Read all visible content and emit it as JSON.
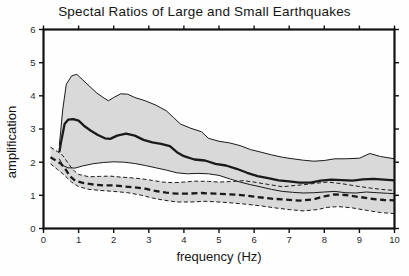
{
  "figure": {
    "background": "#fefefe"
  },
  "chart_data": {
    "type": "line",
    "title": "Spectal Ratios of Large and Small Earthquakes",
    "xlabel": "frequency (Hz)",
    "ylabel": "amplification",
    "xlim": [
      0,
      10
    ],
    "ylim": [
      0,
      6
    ],
    "xticks": [
      0,
      1,
      2,
      3,
      4,
      5,
      6,
      7,
      8,
      9,
      10
    ],
    "yticks": [
      0,
      1,
      2,
      3,
      4,
      5,
      6
    ],
    "grid": false,
    "legend": "none",
    "colors": {
      "band_fill": "#d9d9d9",
      "line": "#1a1a1a",
      "frame": "#111111"
    },
    "series": [
      {
        "name": "large-earthquakes-upper-bound",
        "group": "large",
        "role": "upper",
        "line_style": "solid",
        "line_weight": "thin",
        "points": [
          [
            0.45,
            2.5
          ],
          [
            0.55,
            3.6
          ],
          [
            0.65,
            4.35
          ],
          [
            0.8,
            4.6
          ],
          [
            0.95,
            4.65
          ],
          [
            1.1,
            4.5
          ],
          [
            1.3,
            4.3
          ],
          [
            1.5,
            4.1
          ],
          [
            1.7,
            3.95
          ],
          [
            1.85,
            3.85
          ],
          [
            2.0,
            3.95
          ],
          [
            2.2,
            4.06
          ],
          [
            2.4,
            4.05
          ],
          [
            2.6,
            3.95
          ],
          [
            2.9,
            3.85
          ],
          [
            3.2,
            3.72
          ],
          [
            3.5,
            3.55
          ],
          [
            3.7,
            3.35
          ],
          [
            3.9,
            3.15
          ],
          [
            4.2,
            3.02
          ],
          [
            4.5,
            2.92
          ],
          [
            4.7,
            2.72
          ],
          [
            5.0,
            2.63
          ],
          [
            5.3,
            2.58
          ],
          [
            5.6,
            2.5
          ],
          [
            5.9,
            2.38
          ],
          [
            6.2,
            2.3
          ],
          [
            6.5,
            2.22
          ],
          [
            6.8,
            2.15
          ],
          [
            7.1,
            2.1
          ],
          [
            7.4,
            2.06
          ],
          [
            7.7,
            2.03
          ],
          [
            8.0,
            2.05
          ],
          [
            8.3,
            2.1
          ],
          [
            8.6,
            2.1
          ],
          [
            9.0,
            2.12
          ],
          [
            9.3,
            2.26
          ],
          [
            9.6,
            2.17
          ],
          [
            10,
            2.1
          ]
        ]
      },
      {
        "name": "large-earthquakes-mean",
        "group": "large",
        "role": "mean",
        "line_style": "solid",
        "line_weight": "thick",
        "points": [
          [
            0.45,
            2.3
          ],
          [
            0.5,
            2.6
          ],
          [
            0.6,
            3.15
          ],
          [
            0.7,
            3.28
          ],
          [
            0.85,
            3.3
          ],
          [
            1.0,
            3.25
          ],
          [
            1.15,
            3.1
          ],
          [
            1.35,
            2.95
          ],
          [
            1.55,
            2.82
          ],
          [
            1.75,
            2.72
          ],
          [
            1.9,
            2.7
          ],
          [
            2.1,
            2.8
          ],
          [
            2.35,
            2.86
          ],
          [
            2.6,
            2.8
          ],
          [
            2.85,
            2.67
          ],
          [
            3.1,
            2.6
          ],
          [
            3.35,
            2.55
          ],
          [
            3.6,
            2.48
          ],
          [
            3.8,
            2.3
          ],
          [
            4.0,
            2.18
          ],
          [
            4.3,
            2.08
          ],
          [
            4.6,
            2.05
          ],
          [
            4.9,
            1.95
          ],
          [
            5.2,
            1.9
          ],
          [
            5.5,
            1.8
          ],
          [
            5.8,
            1.68
          ],
          [
            6.1,
            1.58
          ],
          [
            6.4,
            1.52
          ],
          [
            6.7,
            1.45
          ],
          [
            7.0,
            1.42
          ],
          [
            7.3,
            1.38
          ],
          [
            7.6,
            1.38
          ],
          [
            7.9,
            1.44
          ],
          [
            8.2,
            1.47
          ],
          [
            8.5,
            1.46
          ],
          [
            8.8,
            1.44
          ],
          [
            9.1,
            1.48
          ],
          [
            9.4,
            1.5
          ],
          [
            9.7,
            1.47
          ],
          [
            10,
            1.45
          ]
        ]
      },
      {
        "name": "large-earthquakes-lower-bound",
        "group": "large",
        "role": "lower",
        "line_style": "solid",
        "line_weight": "thin",
        "points": [
          [
            0.45,
            2.1
          ],
          [
            0.55,
            1.9
          ],
          [
            0.7,
            1.83
          ],
          [
            0.9,
            1.82
          ],
          [
            1.1,
            1.88
          ],
          [
            1.4,
            1.95
          ],
          [
            1.7,
            1.99
          ],
          [
            2.0,
            2.01
          ],
          [
            2.3,
            2.0
          ],
          [
            2.6,
            1.96
          ],
          [
            2.9,
            1.9
          ],
          [
            3.2,
            1.83
          ],
          [
            3.5,
            1.76
          ],
          [
            3.8,
            1.68
          ],
          [
            4.1,
            1.65
          ],
          [
            4.4,
            1.66
          ],
          [
            4.7,
            1.65
          ],
          [
            5.0,
            1.6
          ],
          [
            5.3,
            1.5
          ],
          [
            5.6,
            1.4
          ],
          [
            5.9,
            1.32
          ],
          [
            6.2,
            1.25
          ],
          [
            6.5,
            1.18
          ],
          [
            6.8,
            1.12
          ],
          [
            7.1,
            1.09
          ],
          [
            7.4,
            1.07
          ],
          [
            7.7,
            1.08
          ],
          [
            8.0,
            1.1
          ],
          [
            8.3,
            1.12
          ],
          [
            8.6,
            1.08
          ],
          [
            8.9,
            1.07
          ],
          [
            9.2,
            1.1
          ],
          [
            9.5,
            1.08
          ],
          [
            9.8,
            1.06
          ],
          [
            10,
            1.05
          ]
        ]
      },
      {
        "name": "small-earthquakes-upper-bound",
        "group": "small",
        "role": "upper",
        "line_style": "dashed",
        "line_weight": "thin",
        "points": [
          [
            0.2,
            2.45
          ],
          [
            0.4,
            2.32
          ],
          [
            0.55,
            2.2
          ],
          [
            0.7,
            1.97
          ],
          [
            0.85,
            1.76
          ],
          [
            1.0,
            1.63
          ],
          [
            1.3,
            1.56
          ],
          [
            1.6,
            1.57
          ],
          [
            1.9,
            1.58
          ],
          [
            2.2,
            1.55
          ],
          [
            2.5,
            1.53
          ],
          [
            2.8,
            1.5
          ],
          [
            3.1,
            1.45
          ],
          [
            3.4,
            1.4
          ],
          [
            3.7,
            1.38
          ],
          [
            4.0,
            1.4
          ],
          [
            4.3,
            1.43
          ],
          [
            4.7,
            1.42
          ],
          [
            5.0,
            1.4
          ],
          [
            5.4,
            1.42
          ],
          [
            5.7,
            1.44
          ],
          [
            6.0,
            1.4
          ],
          [
            6.4,
            1.33
          ],
          [
            6.8,
            1.26
          ],
          [
            7.2,
            1.3
          ],
          [
            7.5,
            1.33
          ],
          [
            7.8,
            1.37
          ],
          [
            8.1,
            1.4
          ],
          [
            8.5,
            1.35
          ],
          [
            8.9,
            1.28
          ],
          [
            9.3,
            1.22
          ],
          [
            9.7,
            1.17
          ],
          [
            10,
            1.15
          ]
        ]
      },
      {
        "name": "small-earthquakes-mean",
        "group": "small",
        "role": "mean",
        "line_style": "dashed",
        "line_weight": "thick",
        "points": [
          [
            0.2,
            2.15
          ],
          [
            0.35,
            2.05
          ],
          [
            0.5,
            1.95
          ],
          [
            0.62,
            1.8
          ],
          [
            0.75,
            1.58
          ],
          [
            0.9,
            1.44
          ],
          [
            1.1,
            1.38
          ],
          [
            1.4,
            1.33
          ],
          [
            1.7,
            1.3
          ],
          [
            2.0,
            1.3
          ],
          [
            2.3,
            1.27
          ],
          [
            2.6,
            1.24
          ],
          [
            2.9,
            1.2
          ],
          [
            3.2,
            1.13
          ],
          [
            3.5,
            1.08
          ],
          [
            3.8,
            1.05
          ],
          [
            4.1,
            1.05
          ],
          [
            4.5,
            1.07
          ],
          [
            4.9,
            1.05
          ],
          [
            5.3,
            1.03
          ],
          [
            5.7,
            1.0
          ],
          [
            6.1,
            0.95
          ],
          [
            6.5,
            0.9
          ],
          [
            6.9,
            0.87
          ],
          [
            7.3,
            0.84
          ],
          [
            7.7,
            0.88
          ],
          [
            8.0,
            0.97
          ],
          [
            8.3,
            1.03
          ],
          [
            8.6,
            1.01
          ],
          [
            9.0,
            0.95
          ],
          [
            9.4,
            0.89
          ],
          [
            9.7,
            0.86
          ],
          [
            10,
            0.85
          ]
        ]
      },
      {
        "name": "small-earthquakes-lower-bound",
        "group": "small",
        "role": "lower",
        "line_style": "dashed",
        "line_weight": "thin",
        "points": [
          [
            0.2,
            1.95
          ],
          [
            0.4,
            1.78
          ],
          [
            0.6,
            1.6
          ],
          [
            0.8,
            1.4
          ],
          [
            1.0,
            1.26
          ],
          [
            1.3,
            1.18
          ],
          [
            1.6,
            1.15
          ],
          [
            2.0,
            1.12
          ],
          [
            2.4,
            1.08
          ],
          [
            2.8,
            1.0
          ],
          [
            3.1,
            0.92
          ],
          [
            3.4,
            0.86
          ],
          [
            3.8,
            0.8
          ],
          [
            4.2,
            0.8
          ],
          [
            4.6,
            0.82
          ],
          [
            5.0,
            0.8
          ],
          [
            5.4,
            0.77
          ],
          [
            5.8,
            0.73
          ],
          [
            6.2,
            0.68
          ],
          [
            6.6,
            0.62
          ],
          [
            7.0,
            0.57
          ],
          [
            7.4,
            0.53
          ],
          [
            7.8,
            0.57
          ],
          [
            8.1,
            0.64
          ],
          [
            8.4,
            0.66
          ],
          [
            8.8,
            0.62
          ],
          [
            9.2,
            0.55
          ],
          [
            9.6,
            0.48
          ],
          [
            10,
            0.45
          ]
        ]
      }
    ]
  }
}
